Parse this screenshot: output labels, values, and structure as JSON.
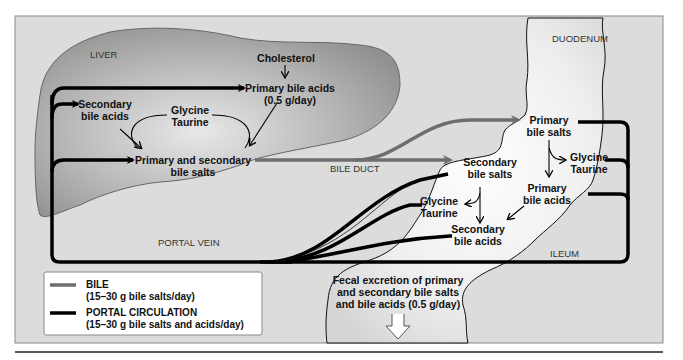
{
  "diagram": {
    "organs": {
      "liver": "LIVER",
      "duodenum": "DUODENUM",
      "ileum": "ILEUM",
      "bile_duct": "BILE DUCT",
      "portal_vein": "PORTAL VEIN"
    },
    "liver_nodes": {
      "cholesterol": "Cholesterol",
      "primary_bile_acids_line1": "Primary bile acids",
      "primary_bile_acids_line2": "(0.5 g/day)",
      "secondary_bile_acids_line1": "Secondary",
      "secondary_bile_acids_line2": "bile acids",
      "conjugates_line1": "Glycine",
      "conjugates_line2": "Taurine",
      "bile_salts_line1": "Primary and secondary",
      "bile_salts_line2": "bile salts"
    },
    "intestine_nodes": {
      "primary_bile_salts_line1": "Primary",
      "primary_bile_salts_line2": "bile salts",
      "glycine_taurine_right_line1": "Glycine",
      "glycine_taurine_right_line2": "Taurine",
      "primary_bile_acids_line1": "Primary",
      "primary_bile_acids_line2": "bile acids",
      "secondary_bile_salts_line1": "Secondary",
      "secondary_bile_salts_line2": "bile salts",
      "glycine_taurine_left_line1": "Glycine",
      "glycine_taurine_left_line2": "Taurine",
      "secondary_bile_acids_line1": "Secondary",
      "secondary_bile_acids_line2": "bile acids"
    },
    "fecal_excretion": {
      "line1": "Fecal excretion of primary",
      "line2": "and secondary bile salts",
      "line3": "and bile acids (0.5 g/day)"
    },
    "legend": {
      "bile_label": "BILE",
      "bile_detail": "(15–30 g bile salts/day)",
      "bile_color": "#6e6e6e",
      "portal_label": "PORTAL CIRCULATION",
      "portal_detail": "(15–30 g bile salts and acids/day)",
      "portal_color": "#000000"
    },
    "colors": {
      "panel_background": "#dcdcdc",
      "liver_fill": "#a8a8a8",
      "intestine_fill": "#f2f2f2",
      "bile_line": "#6e6e6e",
      "portal_line": "#000000"
    }
  }
}
